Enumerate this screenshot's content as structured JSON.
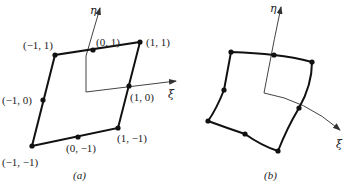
{
  "figure": {
    "panel_a": {
      "caption": "(a)",
      "axis_labels": {
        "eta": "η",
        "xi": "ξ"
      },
      "nodes": [
        {
          "label": "(−1, −1)"
        },
        {
          "label": "(0, −1)"
        },
        {
          "label": "(1, −1)"
        },
        {
          "label": "(1, 0)"
        },
        {
          "label": "(1, 1)"
        },
        {
          "label": "(0, 1)"
        },
        {
          "label": "(−1, 1)"
        },
        {
          "label": "(−1, 0)"
        }
      ]
    },
    "panel_b": {
      "caption": "(b)",
      "axis_labels": {
        "eta": "η",
        "xi": "ξ"
      }
    },
    "colors": {
      "line": "#111111",
      "axis": "#444444"
    }
  }
}
